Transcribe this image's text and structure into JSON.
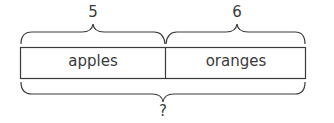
{
  "diagram": {
    "type": "tape-diagram",
    "top_labels": [
      {
        "text": "5",
        "part": "apples"
      },
      {
        "text": "6",
        "part": "oranges"
      }
    ],
    "segments": [
      {
        "label": "apples"
      },
      {
        "label": "oranges"
      }
    ],
    "total_label": "?",
    "colors": {
      "stroke": "#3a3a3a",
      "background": "#ffffff",
      "text": "#3a3a3a"
    }
  }
}
